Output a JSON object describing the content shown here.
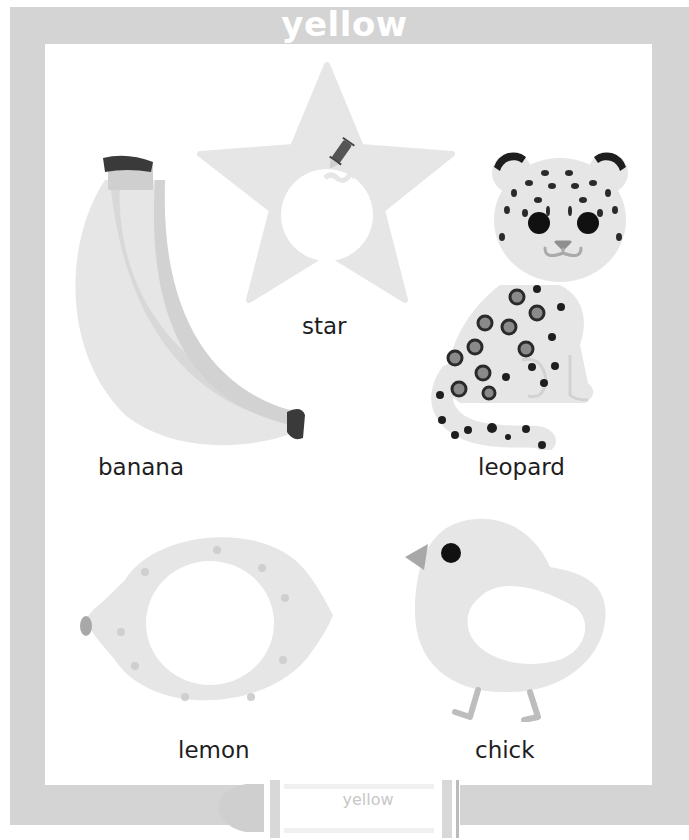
{
  "page": {
    "title": "yellow",
    "colors": {
      "frame": "#d4d4d4",
      "shape_fill": "#e6e6e6",
      "shape_shade": "#d6d6d6",
      "dark": "#3a3a3a",
      "label_text": "#1e1e1e",
      "title_text": "#ffffff"
    }
  },
  "items": [
    {
      "id": "star",
      "label": "star",
      "icon": "star-icon"
    },
    {
      "id": "banana",
      "label": "banana",
      "icon": "banana-icon"
    },
    {
      "id": "leopard",
      "label": "leopard",
      "icon": "leopard-icon"
    },
    {
      "id": "lemon",
      "label": "lemon",
      "icon": "lemon-icon"
    },
    {
      "id": "chick",
      "label": "chick",
      "icon": "chick-icon"
    }
  ],
  "crayon": {
    "label": "yellow",
    "icon": "crayon-icon"
  }
}
